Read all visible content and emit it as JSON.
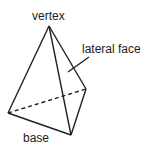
{
  "diagram": {
    "labels": {
      "vertex": "vertex",
      "lateral_face": "lateral face",
      "base": "base"
    },
    "colors": {
      "stroke": "#222222",
      "background": "#ffffff"
    },
    "points": {
      "apex": [
        49,
        26
      ],
      "base_left": [
        8,
        113
      ],
      "base_front": [
        71,
        135
      ],
      "base_right": [
        86,
        89
      ]
    }
  }
}
